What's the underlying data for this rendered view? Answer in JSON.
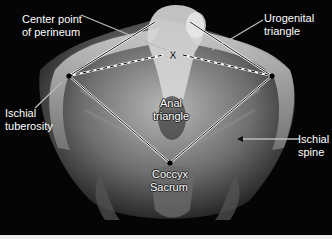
{
  "figure": {
    "background": "#050505",
    "labels": {
      "center_point": [
        "Center point",
        "of perineum"
      ],
      "urogenital": [
        "Urogenital",
        "triangle"
      ],
      "ischial_tuberosity": [
        "Ischial",
        "tuberosity"
      ],
      "anal": [
        "Anal",
        "triangle"
      ],
      "ischial_spine": [
        "Ischial",
        "spine"
      ],
      "coccyx": "Coccyx",
      "sacrum": "Sacrum"
    },
    "markers": {
      "center_point_symbol": "X",
      "left_ischial_tuberosity": [
        69,
        76
      ],
      "right_ischial_tuberosity": [
        272,
        76
      ],
      "coccyx": [
        170,
        163
      ],
      "center_point": [
        173,
        55
      ]
    }
  }
}
